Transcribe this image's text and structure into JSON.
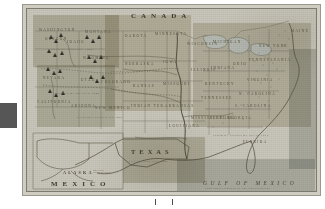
{
  "document": {
    "kind": "scanned-historical-map",
    "subject": "United States",
    "plate_caption": "Territorial Growth of the United States"
  },
  "map": {
    "countries": [
      {
        "name": "CANADA",
        "x": 104,
        "y": 8
      },
      {
        "name": "MEXICO",
        "x": 46,
        "y": 183
      }
    ],
    "states_large": [
      {
        "name": "TEXAS",
        "x": 118,
        "y": 152
      }
    ],
    "water_labels": [
      {
        "name": "GULF OF MEXICO",
        "x": 196,
        "y": 182
      }
    ],
    "inset": {
      "title": "ALASKA",
      "subtitle": "BRITISH POSSESSIONS",
      "x": 38,
      "y": 170
    },
    "region_labels": [
      {
        "name": "OREGON",
        "x": 40,
        "y": 33
      },
      {
        "name": "WASHINGTON",
        "x": 32,
        "y": 24
      },
      {
        "name": "IDAHO",
        "x": 57,
        "y": 36
      },
      {
        "name": "MONTANA",
        "x": 75,
        "y": 26
      },
      {
        "name": "DAKOTA",
        "x": 108,
        "y": 30
      },
      {
        "name": "MINNESOTA",
        "x": 140,
        "y": 28
      },
      {
        "name": "WISCONSIN",
        "x": 166,
        "y": 38
      },
      {
        "name": "MICHIGAN",
        "x": 192,
        "y": 36
      },
      {
        "name": "NEW YORK",
        "x": 240,
        "y": 40
      },
      {
        "name": "MAINE",
        "x": 272,
        "y": 25
      },
      {
        "name": "WYOMING",
        "x": 72,
        "y": 52
      },
      {
        "name": "NEBRASKA",
        "x": 110,
        "y": 58
      },
      {
        "name": "IOWA",
        "x": 144,
        "y": 56
      },
      {
        "name": "ILLINOIS",
        "x": 170,
        "y": 64
      },
      {
        "name": "INDIANA",
        "x": 192,
        "y": 62
      },
      {
        "name": "OHIO",
        "x": 212,
        "y": 58
      },
      {
        "name": "PENNSYLVANIA",
        "x": 234,
        "y": 54
      },
      {
        "name": "NEVADA",
        "x": 40,
        "y": 72
      },
      {
        "name": "UTAH",
        "x": 62,
        "y": 74
      },
      {
        "name": "COLORADO",
        "x": 86,
        "y": 76
      },
      {
        "name": "KANSAS",
        "x": 116,
        "y": 80
      },
      {
        "name": "MISSOURI",
        "x": 146,
        "y": 78
      },
      {
        "name": "KENTUCKY",
        "x": 186,
        "y": 78
      },
      {
        "name": "VIRGINIA",
        "x": 228,
        "y": 74
      },
      {
        "name": "CALIFORNIA",
        "x": 28,
        "y": 96
      },
      {
        "name": "ARIZONA",
        "x": 56,
        "y": 100
      },
      {
        "name": "NEW MEXICO",
        "x": 82,
        "y": 102
      },
      {
        "name": "INDIAN TER.",
        "x": 118,
        "y": 100
      },
      {
        "name": "ARKANSAS",
        "x": 148,
        "y": 100
      },
      {
        "name": "TENNESSEE",
        "x": 184,
        "y": 92
      },
      {
        "name": "N. CAROLINA",
        "x": 224,
        "y": 88
      },
      {
        "name": "S. CAROLINA",
        "x": 218,
        "y": 100
      },
      {
        "name": "LOUISIANA",
        "x": 152,
        "y": 120
      },
      {
        "name": "MISSISSIPPI",
        "x": 172,
        "y": 112
      },
      {
        "name": "ALABAMA",
        "x": 190,
        "y": 112
      },
      {
        "name": "GEORGIA",
        "x": 208,
        "y": 112
      },
      {
        "name": "FLORIDA",
        "x": 222,
        "y": 136
      }
    ],
    "annotations": [
      {
        "text": "CEDED BY MEXICO 1848",
        "x": 54,
        "y": 88
      },
      {
        "text": "LOUISIANA PURCHASE 1803",
        "x": 98,
        "y": 66
      },
      {
        "text": "OREGON COUNTRY 1846",
        "x": 44,
        "y": 44
      },
      {
        "text": "TEXAS ANNEXED 1845",
        "x": 116,
        "y": 160
      },
      {
        "text": "GADSDEN PURCHASE 1853",
        "x": 68,
        "y": 112
      },
      {
        "text": "FLORIDA CEDED BY SPAIN 1819",
        "x": 204,
        "y": 130
      }
    ]
  },
  "overlay": {
    "grey_block_color": "#565656",
    "tick_marks": 2
  },
  "colors": {
    "paper": "#f7f6f2",
    "plate": "#c9c7bb",
    "ink": "#4b4739",
    "border": "#7d7a70",
    "tint_warm": "#b9b19a",
    "tint_cool": "#aab3ad"
  }
}
